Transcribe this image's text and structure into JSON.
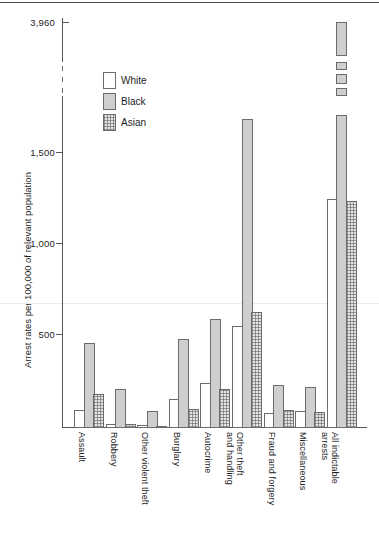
{
  "chart_data": {
    "type": "bar",
    "title": "",
    "xlabel": "",
    "ylabel": "Arrest rates per 100,000 of relevant population",
    "ylim": [
      0,
      2250
    ],
    "y_axis_top_value": 3960,
    "axis_break": true,
    "grid": false,
    "legend_position": "upper-left-inside",
    "ytick_labels": [
      "3,960",
      "1,500",
      "1,000",
      "500"
    ],
    "ytick_values": [
      3960,
      1500,
      1000,
      500
    ],
    "categories": [
      "Assault",
      "Robbery",
      "Other violent theft",
      "Burglary",
      "Autocrime",
      "Other theft and handling",
      "Fraud and forgery",
      "Miscellaneous",
      "All indictable arrests"
    ],
    "category_lines": [
      [
        "Assault"
      ],
      [
        "Robbery"
      ],
      [
        "Other violent theft"
      ],
      [
        "Burglary"
      ],
      [
        "Autocrime"
      ],
      [
        "Other theft",
        "and handling"
      ],
      [
        "Fraud and forgery"
      ],
      [
        "Miscellaneous"
      ],
      [
        "All indictable",
        "arrests"
      ]
    ],
    "series": [
      {
        "name": "White",
        "color": "#ffffff",
        "fill": "empty",
        "values": [
          100,
          20,
          15,
          160,
          250,
          560,
          85,
          95,
          1260
        ]
      },
      {
        "name": "Black",
        "color": "#cfcfcf",
        "fill": "solid-grey",
        "values": [
          465,
          215,
          95,
          490,
          600,
          1700,
          235,
          225,
          3960
        ]
      },
      {
        "name": "Asian",
        "color": "#e3e3e3",
        "fill": "cross-hatch",
        "values": [
          185,
          20,
          10,
          105,
          215,
          640,
          100,
          90,
          1250
        ]
      }
    ],
    "off_scale_bars": [
      {
        "category": "All indictable arrests",
        "series": "Black",
        "value": 3960
      }
    ]
  },
  "legend": {
    "items": [
      {
        "label": "White",
        "swatch": "white-swatch"
      },
      {
        "label": "Black",
        "swatch": "black-swatch"
      },
      {
        "label": "Asian",
        "swatch": "asian-swatch"
      }
    ]
  },
  "axis": {
    "y_title": "Arrest rates per 100,000 of relevant population",
    "ticks": [
      {
        "label": "3,960",
        "value": 3960
      },
      {
        "label": "1,500",
        "value": 1500
      },
      {
        "label": "1,000",
        "value": 1000
      },
      {
        "label": "500",
        "value": 500
      }
    ]
  }
}
